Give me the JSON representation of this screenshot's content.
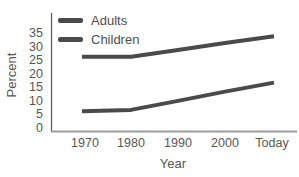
{
  "chart_data": {
    "type": "line",
    "title": "",
    "xlabel": "Year",
    "ylabel": "Percent",
    "categories": [
      "1970",
      "1980",
      "1990",
      "2000",
      "Today"
    ],
    "series": [
      {
        "name": "Adults",
        "values": [
          26.5,
          26.5,
          29.0,
          31.5,
          34.0
        ],
        "color": "#4a4a4a"
      },
      {
        "name": "Children",
        "values": [
          6.5,
          7.0,
          10.3,
          13.7,
          17.0
        ],
        "color": "#4a4a4a"
      }
    ],
    "yticks": [
      0,
      5,
      10,
      15,
      20,
      25,
      30,
      35
    ],
    "ylim": [
      0,
      35
    ],
    "grid": false,
    "legend_position": "top-left",
    "axis_colors": {
      "y_spine": "#5f5f5f",
      "x_axis": "#9c9c9c"
    },
    "text_color": "#565656"
  }
}
